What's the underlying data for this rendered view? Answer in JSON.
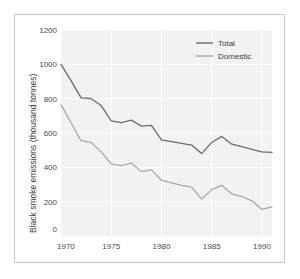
{
  "chart_data": {
    "type": "line",
    "title": "",
    "xlabel": "",
    "ylabel": "Black smoke emissions (thousand tonnes)",
    "xlim": [
      1970,
      1991
    ],
    "ylim": [
      0,
      1200
    ],
    "xticks": [
      1970,
      1975,
      1980,
      1985,
      1990
    ],
    "xticklabels": [
      "1970",
      "1975",
      "1980",
      "1985",
      "1990"
    ],
    "yticks": [
      0,
      200,
      400,
      600,
      800,
      1000,
      1200
    ],
    "yticklabels": [
      "0",
      "200",
      "400",
      "600",
      "800",
      "1000",
      "1200"
    ],
    "grid": true,
    "grid_color": "#ffffff",
    "plot_background": "#f2f2f2",
    "legend_position": "top-right",
    "x": [
      1970,
      1971,
      1972,
      1973,
      1974,
      1975,
      1976,
      1977,
      1978,
      1979,
      1980,
      1981,
      1982,
      1983,
      1984,
      1985,
      1986,
      1987,
      1988,
      1989,
      1990,
      1991
    ],
    "series": [
      {
        "name": "Total",
        "color": "#6b6b6b",
        "values": [
          1000,
          905,
          805,
          800,
          760,
          670,
          660,
          675,
          640,
          645,
          560,
          550,
          540,
          530,
          480,
          545,
          580,
          535,
          520,
          505,
          490,
          487
        ]
      },
      {
        "name": "Domestic",
        "color": "#a8a8a8",
        "values": [
          765,
          660,
          555,
          545,
          490,
          420,
          410,
          425,
          375,
          385,
          325,
          310,
          295,
          285,
          215,
          270,
          295,
          245,
          230,
          205,
          155,
          170
        ]
      }
    ]
  },
  "legend": {
    "items": [
      {
        "label": "Total",
        "color": "#6b6b6b"
      },
      {
        "label": "Domestic",
        "color": "#a8a8a8"
      }
    ]
  },
  "axes": {
    "y_title": "Black smoke emissions (thousand tonnes)",
    "y_zero_label": "0"
  }
}
